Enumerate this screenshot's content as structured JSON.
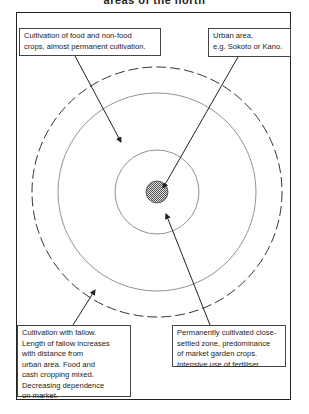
{
  "title": "areas of the north",
  "diagram": {
    "zones": [
      {
        "name": "urban-area",
        "shape": "shaded-circle",
        "radius": 11
      },
      {
        "name": "close-settled-zone",
        "shape": "solid-ring",
        "radius": 42
      },
      {
        "name": "permanent-cultivation-zone",
        "shape": "solid-ring",
        "radius": 99
      },
      {
        "name": "fallow-cultivation-zone",
        "shape": "dashed-ring",
        "radius": 125
      }
    ],
    "labels": {
      "permanent_cultivation": {
        "lines": [
          "Cultivation of food and non-food",
          "crops, almost permanent cultivation."
        ]
      },
      "urban_area": {
        "lines": [
          "Urban area,",
          "e.g. Sokoto or Kano."
        ]
      },
      "fallow_cultivation": {
        "lines": [
          "Cultivation with fallow.",
          "Length of fallow increases",
          "with distance from",
          "urban area. Food and",
          "cash cropping mixed.",
          "Decreasing dependence",
          "on market."
        ]
      },
      "close_settled": {
        "lines": [
          "Permanently cultivated close-",
          "settled zone, predominance",
          "of market garden crops.",
          "Intensive use of fertiliser."
        ]
      }
    },
    "colors": {
      "line": "#333333",
      "ring": "#777777",
      "shade": "#aaaaaa"
    }
  }
}
